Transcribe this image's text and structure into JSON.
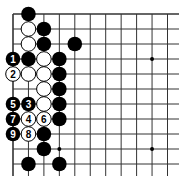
{
  "diagram": {
    "type": "go-board",
    "grid": {
      "x0": 13,
      "y0": 14,
      "dx": 15.45,
      "dy": 15.0,
      "cols": 11,
      "rows": 11,
      "extend_right": 179,
      "extend_bottom": 176
    },
    "star_points": [
      [
        9,
        3
      ],
      [
        3,
        9
      ],
      [
        9,
        9
      ]
    ],
    "stones": [
      {
        "col": 1,
        "row": 0,
        "color": "black"
      },
      {
        "col": 1,
        "row": 1,
        "color": "white"
      },
      {
        "col": 2,
        "row": 1,
        "color": "black"
      },
      {
        "col": 1,
        "row": 2,
        "color": "white"
      },
      {
        "col": 2,
        "row": 2,
        "color": "black"
      },
      {
        "col": 4,
        "row": 2,
        "color": "black"
      },
      {
        "col": 0,
        "row": 3,
        "color": "black",
        "label": "1"
      },
      {
        "col": 1,
        "row": 3,
        "color": "black"
      },
      {
        "col": 2,
        "row": 3,
        "color": "white"
      },
      {
        "col": 3,
        "row": 3,
        "color": "black"
      },
      {
        "col": 0,
        "row": 4,
        "color": "white",
        "label": "2"
      },
      {
        "col": 1,
        "row": 4,
        "color": "white"
      },
      {
        "col": 2,
        "row": 4,
        "color": "white"
      },
      {
        "col": 3,
        "row": 4,
        "color": "black"
      },
      {
        "col": 2,
        "row": 5,
        "color": "white"
      },
      {
        "col": 3,
        "row": 5,
        "color": "black"
      },
      {
        "col": 0,
        "row": 6,
        "color": "black",
        "label": "5"
      },
      {
        "col": 1,
        "row": 6,
        "color": "black",
        "label": "3"
      },
      {
        "col": 2,
        "row": 6,
        "color": "white"
      },
      {
        "col": 3,
        "row": 6,
        "color": "black"
      },
      {
        "col": 0,
        "row": 7,
        "color": "black",
        "label": "7"
      },
      {
        "col": 1,
        "row": 7,
        "color": "white",
        "label": "4"
      },
      {
        "col": 2,
        "row": 7,
        "color": "white",
        "label": "6"
      },
      {
        "col": 3,
        "row": 7,
        "color": "black"
      },
      {
        "col": 0,
        "row": 8,
        "color": "black",
        "label": "9"
      },
      {
        "col": 1,
        "row": 8,
        "color": "white",
        "label": "8"
      },
      {
        "col": 2,
        "row": 8,
        "color": "black"
      },
      {
        "col": 2,
        "row": 9,
        "color": "black"
      },
      {
        "col": 1,
        "row": 10,
        "color": "black"
      },
      {
        "col": 3,
        "row": 10,
        "color": "black"
      }
    ]
  }
}
